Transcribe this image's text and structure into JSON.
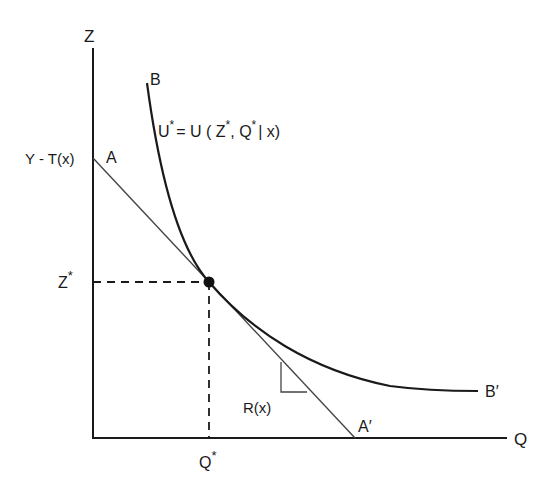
{
  "diagram": {
    "type": "indifference-curve-budget-line",
    "axes": {
      "y_label": "Z",
      "x_label": "Q"
    },
    "labels": {
      "curve_start": "B",
      "curve_end": "B′",
      "line_start": "A",
      "line_end": "A′",
      "intercept": "Y - T(x)",
      "z_star": "Z",
      "q_star": "Q",
      "star": "*",
      "slope": "R(x)",
      "utility_u": "U",
      "utility_rest": "= U ( Z",
      "utility_comma": ", Q",
      "utility_tail": "| x)"
    },
    "colors": {
      "ink": "#1a1a1a",
      "thin_line": "#444444",
      "background": "#ffffff"
    }
  }
}
